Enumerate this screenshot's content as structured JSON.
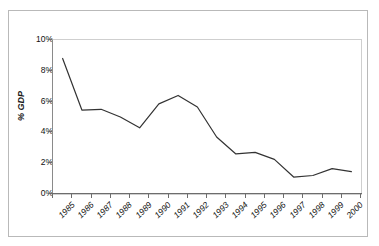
{
  "chart_data": {
    "type": "line",
    "title": "",
    "subtitle": "",
    "xlabel": "",
    "ylabel": "% GDP",
    "categories": [
      "1985",
      "1986",
      "1987",
      "1988",
      "1989",
      "1990",
      "1991",
      "1992",
      "1993",
      "1994",
      "1995",
      "1996",
      "1997",
      "1998",
      "1999",
      "2000"
    ],
    "values": [
      8.8,
      5.45,
      5.5,
      5.0,
      4.3,
      5.85,
      6.4,
      5.65,
      3.7,
      2.6,
      2.7,
      2.25,
      1.1,
      1.2,
      1.65,
      1.45
    ],
    "series": [
      {
        "name": "% GDP",
        "values": [
          8.8,
          5.45,
          5.5,
          5.0,
          4.3,
          5.85,
          6.4,
          5.65,
          3.7,
          2.6,
          2.7,
          2.25,
          1.1,
          1.2,
          1.65,
          1.45
        ]
      }
    ],
    "ylim": [
      0,
      10
    ],
    "ytick_labels": [
      "0%",
      "2%",
      "4%",
      "6%",
      "8%",
      "10%"
    ],
    "ytick_values": [
      0,
      2,
      4,
      6,
      8,
      10
    ],
    "yunit": "%",
    "grid": false,
    "legend": false,
    "legend_position": "none",
    "annotations": [],
    "line_color": "#333333",
    "plot_border_color": "#cfcfcf",
    "axis_color": "#6d6d6d",
    "background_color": "#ffffff",
    "figure_border_color": "#b9b9b9"
  }
}
